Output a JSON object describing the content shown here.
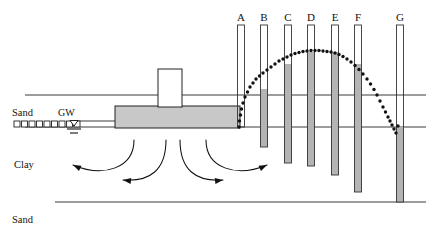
{
  "diagram": {
    "type": "geotechnical-cross-section"
  },
  "strata_labels": [
    {
      "name": "sand-upper-label",
      "text": "Sand",
      "x": 12,
      "y": 108
    },
    {
      "name": "clay-label",
      "text": "Clay",
      "x": 14,
      "y": 160
    },
    {
      "name": "sand-lower-label",
      "text": "Sand",
      "x": 12,
      "y": 215
    }
  ],
  "groundwater": {
    "label": "GW",
    "label_x": 58,
    "label_y": 108,
    "symbol_x": 74,
    "symbol_y": 124
  },
  "hatch": {
    "name": "sand-hatch-row",
    "count": 9,
    "start_x": 14,
    "y": 121,
    "box": 6,
    "gap": 7.5
  },
  "foundation": {
    "footing": {
      "x": 115,
      "y": 106,
      "w": 125,
      "h": 22,
      "fill": "#c8c8c8",
      "stroke": "#222222"
    },
    "column": {
      "x": 158,
      "y": 69,
      "w": 24,
      "h": 38,
      "fill": "#ffffff",
      "stroke": "#222222"
    }
  },
  "ground_lines": [
    {
      "name": "ground-surface-line",
      "x1": 25,
      "y1": 95,
      "x2": 426,
      "y2": 95
    },
    {
      "name": "sand-clay-boundary-line",
      "x1": 25,
      "y1": 127,
      "x2": 426,
      "y2": 127
    },
    {
      "name": "clay-sand-boundary-line",
      "x1": 55,
      "y1": 202,
      "x2": 426,
      "y2": 202
    },
    {
      "name": "gw-level-line",
      "x1": 74,
      "y1": 121,
      "x2": 134,
      "y2": 121
    }
  ],
  "chart_data": {
    "type": "line",
    "xlabel": "Piezometer",
    "ylabel": "Water level (screen y, px)",
    "categories": [
      "A",
      "B",
      "C",
      "D",
      "E",
      "F",
      "G"
    ],
    "values": [
      127,
      89,
      64,
      52,
      52,
      64,
      127
    ],
    "grid": false,
    "legend": "none",
    "annotation": "dotted arc connecting water levels in standpipes"
  },
  "piles": [
    {
      "label": "A",
      "x": 241,
      "top": 25,
      "bottom": 127,
      "water_y": 127,
      "filled": false
    },
    {
      "label": "B",
      "x": 264,
      "top": 25,
      "bottom": 147,
      "water_y": 89,
      "filled": true
    },
    {
      "label": "C",
      "x": 288,
      "top": 25,
      "bottom": 163,
      "water_y": 64,
      "filled": true
    },
    {
      "label": "D",
      "x": 311,
      "top": 25,
      "bottom": 166,
      "water_y": 52,
      "filled": true
    },
    {
      "label": "E",
      "x": 335,
      "top": 25,
      "bottom": 175,
      "water_y": 52,
      "filled": true
    },
    {
      "label": "F",
      "x": 358,
      "top": 25,
      "bottom": 192,
      "water_y": 64,
      "filled": true
    },
    {
      "label": "G",
      "x": 400,
      "top": 25,
      "bottom": 202,
      "water_y": 127,
      "filled": true
    }
  ],
  "pile_style": {
    "width": 7,
    "stroke": "#333333",
    "fill_empty": "#ffffff",
    "fill_water": "#b4b4b4",
    "label_y": 12
  },
  "dotted_curve": {
    "name": "pore-pressure-arc",
    "color": "#111111",
    "dot_radius": 1.7,
    "points": [
      [
        239,
        127
      ],
      [
        239.5,
        121
      ],
      [
        240.5,
        115
      ],
      [
        241.5,
        109
      ],
      [
        243,
        103
      ],
      [
        245,
        97
      ],
      [
        247.5,
        92
      ],
      [
        250,
        87
      ],
      [
        253,
        83
      ],
      [
        256,
        79
      ],
      [
        259.5,
        76
      ],
      [
        263,
        73
      ],
      [
        267,
        70
      ],
      [
        271,
        67
      ],
      [
        275,
        64
      ],
      [
        279,
        61
      ],
      [
        283,
        59
      ],
      [
        287,
        57
      ],
      [
        291,
        55
      ],
      [
        295,
        53.5
      ],
      [
        299,
        52.5
      ],
      [
        303,
        51.5
      ],
      [
        307,
        51
      ],
      [
        311,
        50.5
      ],
      [
        315,
        50.5
      ],
      [
        319,
        50.5
      ],
      [
        323,
        51
      ],
      [
        327,
        51.5
      ],
      [
        331,
        52
      ],
      [
        335,
        53
      ],
      [
        339,
        54.5
      ],
      [
        343,
        56.5
      ],
      [
        347,
        59
      ],
      [
        351,
        62
      ],
      [
        355,
        65.5
      ],
      [
        359,
        69.5
      ],
      [
        363,
        74
      ],
      [
        367,
        79
      ],
      [
        370.5,
        84
      ],
      [
        374,
        89.5
      ],
      [
        377,
        95
      ],
      [
        380,
        101
      ],
      [
        383,
        107
      ],
      [
        385.5,
        112
      ],
      [
        388,
        117
      ],
      [
        390,
        121
      ],
      [
        392,
        125
      ],
      [
        394,
        129
      ],
      [
        396,
        133
      ],
      [
        398,
        126
      ]
    ]
  },
  "flow_arrows": [
    {
      "name": "flow-arrow-left-outer",
      "path": "M 134,140 C 134,168 104,178 73,165",
      "arrow_at": [
        73,
        165
      ],
      "arrow_angle": 205
    },
    {
      "name": "flow-arrow-left-inner",
      "path": "M 166,140 C 166,170 150,182 123,180",
      "arrow_at": [
        123,
        180
      ],
      "arrow_angle": 187
    },
    {
      "name": "flow-arrow-right-inner",
      "path": "M 180,140 C 180,170 196,182 223,180",
      "arrow_at": [
        223,
        180
      ],
      "arrow_angle": -7
    },
    {
      "name": "flow-arrow-right-outer",
      "path": "M 206,140 C 206,168 236,178 267,165",
      "arrow_at": [
        267,
        165
      ],
      "arrow_angle": -25
    }
  ]
}
